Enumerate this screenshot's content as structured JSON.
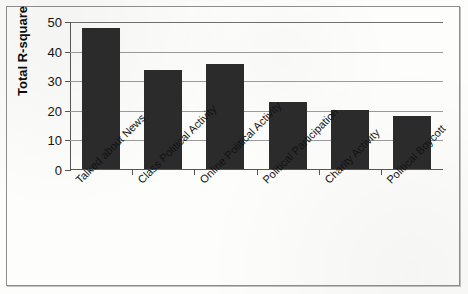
{
  "chart_data": {
    "type": "bar",
    "title": "",
    "xlabel": "",
    "ylabel": "Total R-square",
    "ylim": [
      0,
      50
    ],
    "ytick_values": [
      0,
      10,
      20,
      30,
      40,
      50
    ],
    "ytick_labels": [
      "0",
      "10",
      "20",
      "30",
      "40",
      "50"
    ],
    "grid": "horizontal",
    "legend": "none",
    "bar_color": "#2b2b2b",
    "categories": [
      "Talked about News",
      "Class Political Activity",
      "Online Political Activity",
      "Political Participation",
      "Charity Activity",
      "Political Boycott"
    ],
    "values": [
      47.5,
      33.5,
      35.5,
      22.5,
      20.0,
      18.0
    ]
  },
  "figure": {
    "border_color": "#8d8d8d",
    "background": "#fdfdfc"
  }
}
